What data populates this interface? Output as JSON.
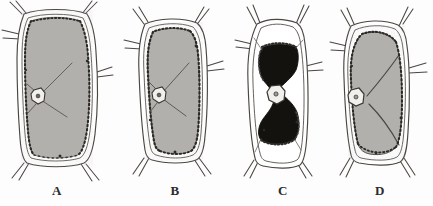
{
  "figure": {
    "background_color": "#fdfdfd",
    "width": 433,
    "height": 206,
    "medium": "ink and wash botanical illustration"
  },
  "palette": {
    "ink": "#3a3632",
    "wall_line": "#4a4640",
    "protoplast_gray": "#b2b0ad",
    "protoplast_gray_dark": "#9c9a96",
    "protoplast_black": "#14120f",
    "nucleus_fill": "#f2f0ec",
    "vacuole_white": "#ffffff",
    "label_color": "#2b2b2b"
  },
  "cells": [
    {
      "id": "cell-a",
      "label": "A",
      "label_x": 57,
      "label_y": 190,
      "state": "turgid",
      "protoplast_fill": "#b2b0ad",
      "description": "Fully turgid cell; protoplast pressed against the cell wall, nucleus at the left margin with cytoplasmic strands"
    },
    {
      "id": "cell-b",
      "label": "B",
      "label_x": 175,
      "label_y": 190,
      "state": "incipient-plasmolysis",
      "protoplast_fill": "#b2b0ad",
      "description": "Beginning plasmolysis; protoplast slightly withdrawn at the corners, nucleus still lateral"
    },
    {
      "id": "cell-c",
      "label": "C",
      "label_x": 283,
      "label_y": 190,
      "state": "plasmolysed",
      "protoplast_fill": "#14120f",
      "description": "Strongly plasmolysed; dark contracted protoplast forms an hourglass, clear space between protoplast and wall"
    },
    {
      "id": "cell-d",
      "label": "D",
      "label_x": 380,
      "label_y": 190,
      "state": "deplasmolysed",
      "protoplast_fill": "#b2b0ad",
      "description": "Recovering cell; rounded two-lobed protoplast again filling most of the lumen"
    }
  ]
}
